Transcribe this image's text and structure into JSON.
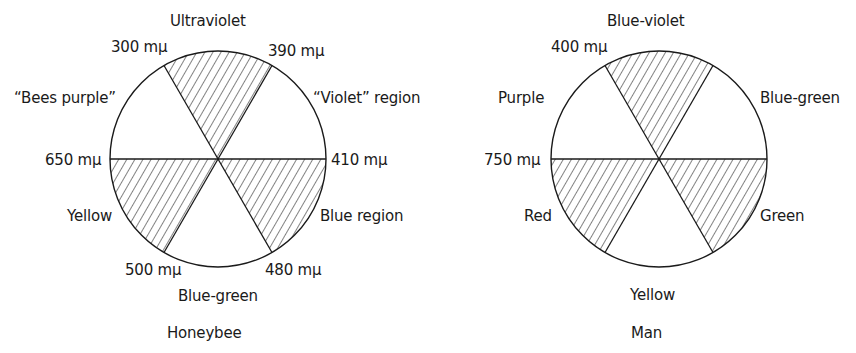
{
  "diagrams": [
    {
      "id": "honeybee",
      "caption": "Honeybee",
      "regions": {
        "top": "Ultraviolet",
        "upper_left": "“Bees purple”",
        "upper_right": "“Violet” region",
        "lower_left": "Yellow",
        "lower_right": "Blue region",
        "bottom": "Blue-green"
      },
      "wavelengths": {
        "top_left": "300 mμ",
        "top_right": "390 mμ",
        "left": "650 mμ",
        "right": "410 mμ",
        "bottom_left": "500 mμ",
        "bottom_right": "480 mμ"
      },
      "hatched_sectors": [
        "top",
        "lower_left",
        "lower_right"
      ]
    },
    {
      "id": "man",
      "caption": "Man",
      "regions": {
        "top": "Blue-violet",
        "upper_left": "Purple",
        "upper_right": "Blue-green",
        "lower_left": "Red",
        "lower_right": "Green",
        "bottom": "Yellow"
      },
      "wavelengths": {
        "top_left": "400 mμ",
        "left": "750 mμ"
      },
      "hatched_sectors": [
        "top",
        "lower_left",
        "lower_right"
      ]
    }
  ],
  "colors": {
    "ink": "#1a1a1a",
    "background": "#ffffff"
  }
}
